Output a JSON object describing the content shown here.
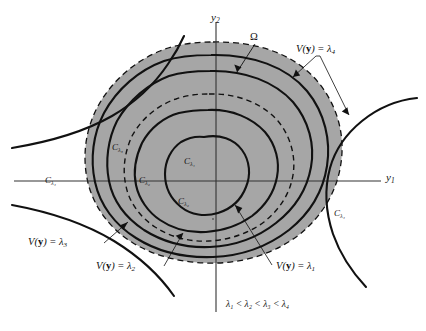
{
  "figure": {
    "type": "lyapunov-level-set-diagram",
    "colors": {
      "shaded_region": "#a6a6a6",
      "curve": "#111111",
      "axis": "#333333",
      "background": "#ffffff"
    },
    "axes": {
      "x_label": "y",
      "x_label_sub": "1",
      "y_label": "y",
      "y_label_sub": "2"
    },
    "region_label": {
      "text": "Ω",
      "name": "omega"
    },
    "level_labels": [
      {
        "id": "v4",
        "prefix": "V(",
        "bold": "y",
        "mid": ") = λ",
        "sub": "4"
      },
      {
        "id": "v3",
        "prefix": "V(",
        "bold": "y",
        "mid": ") = λ",
        "sub": "3"
      },
      {
        "id": "v2",
        "prefix": "V(",
        "bold": "y",
        "mid": ") = λ",
        "sub": "2"
      },
      {
        "id": "v1",
        "prefix": "V(",
        "bold": "y",
        "mid": ") = λ",
        "sub": "1"
      }
    ],
    "contour_labels": [
      {
        "id": "c_lambda1",
        "base": "C",
        "sub": "λ₁"
      },
      {
        "id": "c_lambda2_inner",
        "base": "C",
        "sub": "λ₂"
      },
      {
        "id": "c_lambda2_left",
        "base": "C",
        "sub": "λ₂"
      },
      {
        "id": "c_lambda3_left",
        "base": "C",
        "sub": "λ₃"
      },
      {
        "id": "c_lambda4_left",
        "base": "C",
        "sub": "λ₄"
      },
      {
        "id": "c_lambda4_right",
        "base": "C",
        "sub": "λ₄"
      }
    ],
    "inequality": "λ₁ < λ₂ < λ₃ < λ₄"
  }
}
